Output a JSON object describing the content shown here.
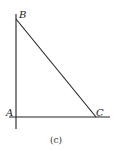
{
  "figure": {
    "caption": "(c)",
    "vertices": {
      "A": {
        "label": "A",
        "x": 16,
        "y": 117
      },
      "B": {
        "label": "B",
        "x": 16,
        "y": 19
      },
      "C": {
        "label": "C",
        "x": 96,
        "y": 117
      }
    },
    "line_color": "#222222"
  }
}
